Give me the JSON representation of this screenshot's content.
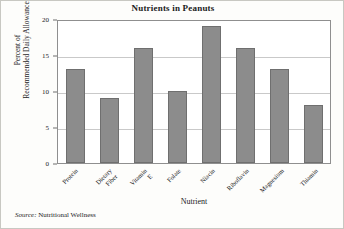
{
  "chart_data": {
    "type": "bar",
    "title": "Nutrients in Peanuts",
    "xlabel": "Nutrient",
    "ylabel": "Percent of Recommended Daily Allowance",
    "categories": [
      "Protein",
      "Dietary Fiber",
      "Vitamin E",
      "Folate",
      "Niacin",
      "Riboflavin",
      "Magnesium",
      "Thiamin"
    ],
    "values": [
      13,
      9,
      16,
      10,
      19,
      16,
      13,
      8
    ],
    "ylim": [
      0,
      20
    ],
    "yticks": [
      0,
      5,
      10,
      15,
      20
    ],
    "ytick_labels": [
      "0",
      "5",
      "10",
      "15",
      "20"
    ],
    "grid": true,
    "grid_axis": "y",
    "legend": "none",
    "bar_color": "#8c8c8c",
    "bar_edge_color": "#6f6f6f",
    "axis_color": "#8f8f8f",
    "grid_color": "#c9c9c9",
    "background_color": "#fdfdfb"
  },
  "figure": {
    "title": "Nutrients in Peanuts",
    "y_axis_title_line1": "Percent of",
    "y_axis_title_line2": "Recommended Daily Allowance",
    "x_axis_title": "Nutrient"
  },
  "source": {
    "label": "Source:",
    "text": "Nutritional Wellness"
  }
}
